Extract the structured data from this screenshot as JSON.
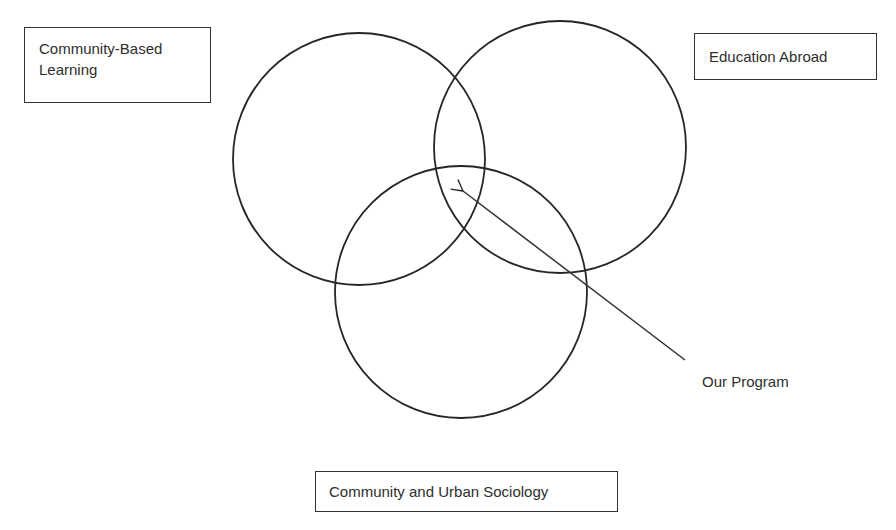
{
  "diagram": {
    "type": "venn",
    "sets": [
      {
        "id": "cbl",
        "label": "Community-Based Learning",
        "label_lines": [
          "Community-Based",
          "Learning"
        ],
        "circle": {
          "cx": 359,
          "cy": 159,
          "r": 126
        }
      },
      {
        "id": "ea",
        "label": "Education Abroad",
        "circle": {
          "cx": 560,
          "cy": 147,
          "r": 126
        }
      },
      {
        "id": "cus",
        "label": "Community and Urban Sociology",
        "circle": {
          "cx": 461,
          "cy": 292,
          "r": 126
        }
      }
    ],
    "annotation": {
      "label": "Our Program",
      "points_to": "intersection of all three sets",
      "arrow": {
        "x1": 685,
        "y1": 360,
        "x2": 462,
        "y2": 190
      }
    },
    "colors": {
      "stroke": "#262626",
      "text": "#2e2e2e",
      "background": "#ffffff"
    }
  },
  "labels": {
    "cbl_line1": "Community-Based",
    "cbl_line2": "Learning",
    "ea": "Education Abroad",
    "cus": "Community and Urban Sociology",
    "our_program": "Our Program"
  }
}
